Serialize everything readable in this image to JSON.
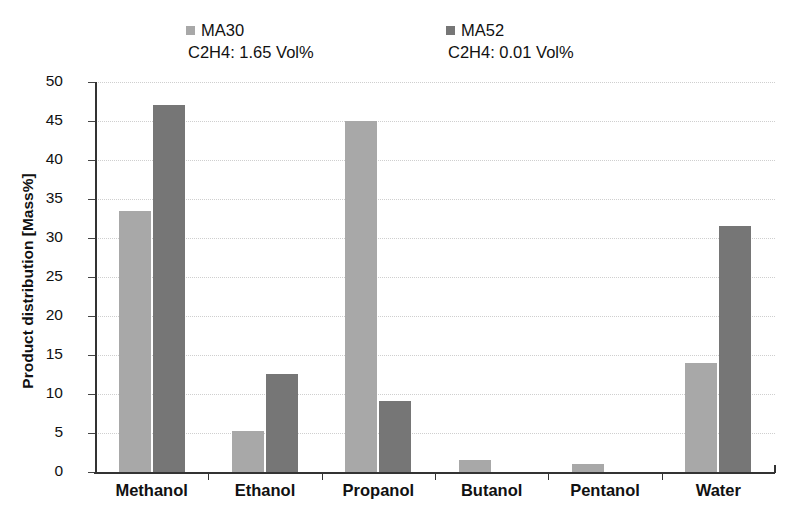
{
  "legend": {
    "entries": [
      {
        "name": "MA30",
        "sub": "C2H4: 1.65 Vol%",
        "color": "#a8a8a8"
      },
      {
        "name": "MA52",
        "sub": "C2H4: 0.01 Vol%",
        "color": "#767676"
      }
    ]
  },
  "axis": {
    "y_title": "Product distribution [Mass%]",
    "y_ticks": [
      "0",
      "5",
      "10",
      "15",
      "20",
      "25",
      "30",
      "35",
      "40",
      "45",
      "50"
    ]
  },
  "chart_data": {
    "type": "bar",
    "title": "",
    "xlabel": "",
    "ylabel": "Product distribution [Mass%]",
    "ylim": [
      0,
      50
    ],
    "ytick_step": 5,
    "grid": true,
    "legend_position": "top",
    "categories": [
      "Methanol",
      "Ethanol",
      "Propanol",
      "Butanol",
      "Pentanol",
      "Water"
    ],
    "series": [
      {
        "name": "MA30",
        "sublabel": "C2H4: 1.65 Vol%",
        "color": "#a8a8a8",
        "values": [
          33.5,
          5.3,
          45.0,
          1.5,
          1.0,
          14.0
        ]
      },
      {
        "name": "MA52",
        "sublabel": "C2H4: 0.01 Vol%",
        "color": "#767676",
        "values": [
          47.0,
          12.6,
          9.1,
          0,
          0,
          31.5
        ]
      }
    ]
  }
}
